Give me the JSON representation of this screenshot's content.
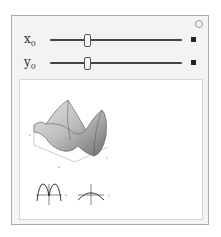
{
  "controls": [
    {
      "name": "x0",
      "label_base": "x",
      "label_sub": "0",
      "thumb_position_pct": 27
    },
    {
      "name": "y0",
      "label_base": "y",
      "label_sub": "0",
      "thumb_position_pct": 27
    }
  ],
  "options_icon": "gear-icon",
  "expand_icon": "plus-icon",
  "output": {
    "surface_plot": {
      "axes": [
        "x",
        "y",
        "z"
      ]
    },
    "slice_plots": [
      {
        "name": "x-slice",
        "axis_label": "x"
      },
      {
        "name": "y-slice",
        "axis_label": "y"
      }
    ]
  },
  "colors": {
    "panel_bg": "#f3f3f3",
    "panel_border": "#a9a9a9",
    "track": "#444444",
    "output_bg": "#ffffff"
  }
}
